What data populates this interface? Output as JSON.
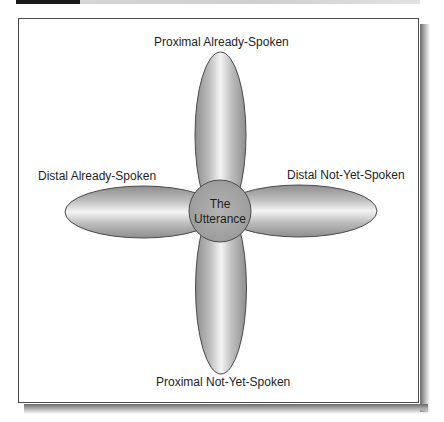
{
  "figure": {
    "header_bar": {
      "dark_segment_color": "#1a1a1a",
      "light_segment_color": "#d4d4d4"
    },
    "diagram": {
      "center": {
        "line1": "The",
        "line2": "Utterance",
        "fill": "#a9a9a9"
      },
      "petals": {
        "top": {
          "label": "Proximal Already-Spoken"
        },
        "left": {
          "label": "Distal Already-Spoken"
        },
        "right": {
          "label": "Distal Not-Yet-Spoken"
        },
        "bottom": {
          "label": "Proximal Not-Yet-Spoken"
        }
      },
      "colors": {
        "petal_edge": "#8e8e8e",
        "petal_highlight": "#f4f4f4",
        "outline": "#4a4a4a"
      }
    }
  }
}
